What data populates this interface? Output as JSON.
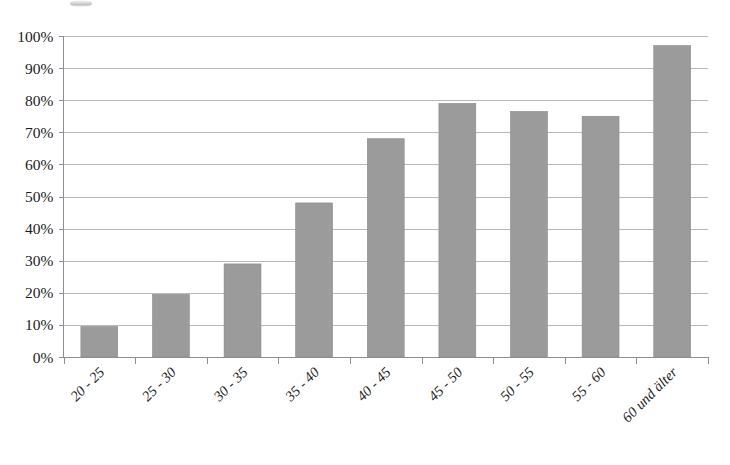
{
  "chart_data": {
    "type": "bar",
    "title": "",
    "subtitle": "",
    "xlabel": "",
    "ylabel": "",
    "categories": [
      "20 - 25",
      "25 - 30",
      "30 - 35",
      "35 - 40",
      "40 - 45",
      "45 - 50",
      "50 - 55",
      "55 - 60",
      "60 und älter"
    ],
    "values": [
      9.5,
      19.5,
      29,
      48,
      68,
      79,
      76.5,
      75,
      97
    ],
    "value_unit": "%",
    "ylim": [
      0,
      100
    ],
    "ytick_step": 10,
    "ytick_labels": [
      "0%",
      "10%",
      "20%",
      "30%",
      "40%",
      "50%",
      "60%",
      "70%",
      "80%",
      "90%",
      "100%"
    ],
    "ytick_values": [
      0,
      10,
      20,
      30,
      40,
      50,
      60,
      70,
      80,
      90,
      100
    ],
    "grid": "horizontal",
    "legend": "none",
    "bar_color": "#9b9b9b",
    "gridline_color": "#b9b9b9",
    "axis_color": "#8f8f8f",
    "text_color": "#1c1c1c",
    "xtick_label_rotation": -45,
    "series": [
      {
        "name": "",
        "values": [
          9.5,
          19.5,
          29,
          48,
          68,
          79,
          76.5,
          75,
          97
        ]
      }
    ]
  },
  "figure": {
    "background": "#ffffff",
    "width": 730,
    "height": 465
  }
}
